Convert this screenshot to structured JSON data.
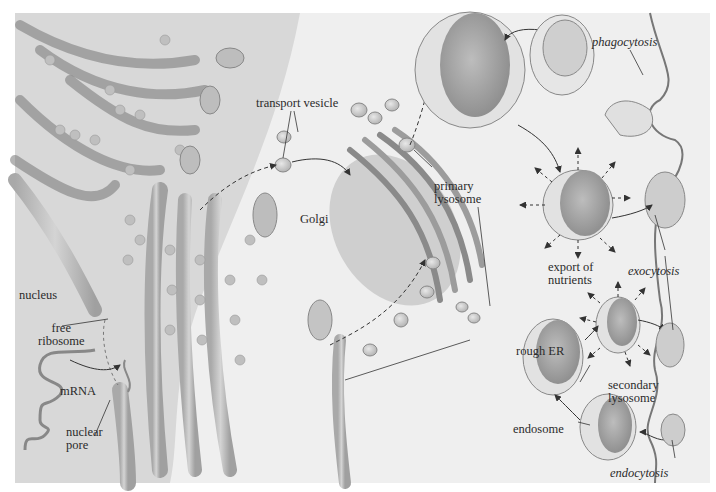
{
  "diagram": {
    "labels": {
      "nucleus": "nucleus",
      "free_ribosome_line1": "free",
      "free_ribosome_line2": "ribosome",
      "mrna": "mRNA",
      "nuclear_pore_line1": "nuclear",
      "nuclear_pore_line2": "pore",
      "transport_vesicle": "transport vesicle",
      "golgi": "Golgi",
      "primary_lysosome_line1": "primary",
      "primary_lysosome_line2": "lysosome",
      "rough_er": "rough ER",
      "phagocytosis": "phagocytosis",
      "export_line1": "export of",
      "export_line2": "nutrients",
      "exocytosis": "exocytosis",
      "secondary_lysosome_line1": "secondary",
      "secondary_lysosome_line2": "lysosome",
      "endosome": "endosome",
      "endocytosis": "endocytosis"
    },
    "colors": {
      "background": "#efefef",
      "membrane": "#7a7a7a",
      "organelle_fill": "#c9c9c9",
      "dark_fill": "#9a9a9a",
      "label_text": "#2b2b2b"
    }
  }
}
